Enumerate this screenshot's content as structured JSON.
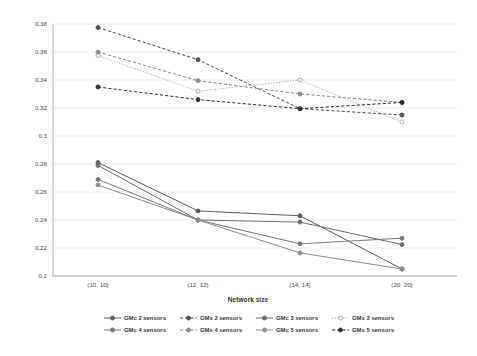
{
  "chart_data": {
    "type": "line",
    "title": "",
    "xlabel": "Network size",
    "ylabel": "",
    "categories": [
      "(10, 10)",
      "(12, 12)",
      "(14, 14)",
      "(20, 20)"
    ],
    "ylim": [
      0.2,
      0.38
    ],
    "ytick_labels": [
      "0.38",
      "0.36",
      "0.34",
      "0.32",
      "0.3",
      "0.28",
      "0.26",
      "0.24",
      "0.22",
      "0.2"
    ],
    "ytick_values": [
      0.38,
      0.36,
      0.34,
      0.32,
      0.3,
      0.28,
      0.26,
      0.24,
      0.22,
      0.2
    ],
    "grid": true,
    "legend_position": "bottom",
    "series": [
      {
        "name": "GMc 2 sensors",
        "style": "solid",
        "color": "#5a5a5a",
        "marker": "circle",
        "values": [
          0.281,
          0.2465,
          0.243,
          0.205
        ]
      },
      {
        "name": "GMs 2 sensors",
        "style": "dashed",
        "color": "#4f4f4f",
        "marker": "circle",
        "values": [
          0.3775,
          0.3545,
          0.3195,
          0.315
        ]
      },
      {
        "name": "GMc 3 sensors",
        "style": "solid",
        "color": "#6b6b6b",
        "marker": "circle",
        "values": [
          0.279,
          0.24,
          0.2385,
          0.2225
        ]
      },
      {
        "name": "GMs 3 sensors",
        "style": "dotted",
        "color": "#a8a8a8",
        "marker": "circle-open",
        "values": [
          0.3575,
          0.332,
          0.34,
          0.31
        ]
      },
      {
        "name": "GMc 4 sensors",
        "style": "solid",
        "color": "#777777",
        "marker": "circle",
        "values": [
          0.269,
          0.24,
          0.223,
          0.227
        ]
      },
      {
        "name": "GMs 4 sensors",
        "style": "dashed",
        "color": "#8a8a8a",
        "marker": "circle",
        "values": [
          0.36,
          0.3395,
          0.33,
          0.324
        ]
      },
      {
        "name": "GMc 5 sensors",
        "style": "solid",
        "color": "#8c8c8c",
        "marker": "circle",
        "values": [
          0.265,
          0.24,
          0.2165,
          0.205
        ]
      },
      {
        "name": "GMs 5 sensors",
        "style": "dashed",
        "color": "#2e2e2e",
        "marker": "circle-filled",
        "values": [
          0.335,
          0.326,
          0.3195,
          0.324
        ]
      }
    ]
  },
  "legend": {
    "rows": [
      [
        "GMc 2 sensors",
        "GMs 2 sensors",
        "GMc 3 sensors",
        "GMs 3 sensors"
      ],
      [
        "GMc 4 sensors",
        "GMs 4 sensors",
        "GMc 5 sensors",
        "GMs 5 sensors"
      ]
    ]
  },
  "axis": {
    "x_title": "Network size"
  }
}
